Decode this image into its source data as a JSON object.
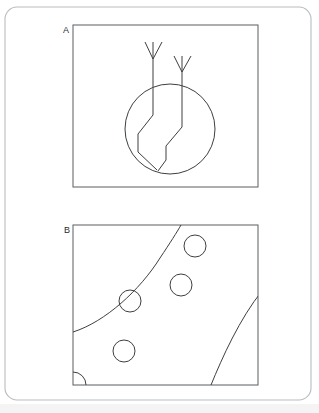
{
  "figure": {
    "title": "",
    "background_color": "#ffffff",
    "width": 319,
    "height": 413,
    "outer_frame": {
      "name": "rounded-slide-frame",
      "x": 5,
      "y": 7,
      "width": 306,
      "height": 393,
      "corner_radius": 12,
      "stroke_color": "#b9bcbf"
    },
    "panels": [
      {
        "id": "A",
        "label": "A",
        "label_x": 63,
        "label_y": 33,
        "box": {
          "x": 73,
          "y": 25,
          "width": 185,
          "height": 162
        },
        "description": "circle intersected by two bent arrow shafts with V arrowheads pointing downward",
        "stroke_color": "#3c3f42",
        "circle": {
          "cx": 170,
          "cy": 129,
          "r": 45
        },
        "arrows": [
          {
            "name": "arrow-left",
            "head_apex_x": 153,
            "head_apex_y": 59,
            "head_left_x": 145,
            "head_left_y": 42,
            "head_right_x": 162,
            "head_right_y": 42,
            "shaft_points": "153,42 153,115 138,134 138,152 157,170"
          },
          {
            "name": "arrow-right",
            "head_apex_x": 182,
            "head_apex_y": 72,
            "head_left_x": 174,
            "head_left_y": 56,
            "head_right_x": 191,
            "head_right_y": 56,
            "shaft_points": "182,56 182,127 166,146 166,160 158,171"
          }
        ]
      },
      {
        "id": "B",
        "label": "B",
        "label_x": 64,
        "label_y": 233,
        "box": {
          "x": 73,
          "y": 225,
          "width": 185,
          "height": 160
        },
        "description": "two curved diagonal boundaries crossing the frame with five circular outlines between them",
        "stroke_color": "#3c3f42",
        "curves": [
          {
            "name": "upper-left-curve",
            "path": "M 73,332 C 105,322 140,290 160,258 C 170,243 177,232 181,225"
          },
          {
            "name": "lower-right-curve",
            "path": "M 211,385 C 222,358 240,318 262,291 C 272,279 280,272 287,266"
          }
        ],
        "circles": [
          {
            "name": "circle-top-right",
            "cx": 195,
            "cy": 246,
            "r": 11
          },
          {
            "name": "circle-mid-right",
            "cx": 181,
            "cy": 285,
            "r": 11
          },
          {
            "name": "circle-mid-left",
            "cx": 130,
            "cy": 301,
            "r": 11
          },
          {
            "name": "circle-lower-left",
            "cx": 124,
            "cy": 351,
            "r": 11
          },
          {
            "name": "circle-corner-quarter",
            "cx": 73,
            "cy": 385,
            "r": 13
          }
        ]
      }
    ],
    "bottom_strip": {
      "x": 0,
      "y": 404,
      "width": 319,
      "height": 9,
      "color": "#f4f4f5"
    }
  }
}
